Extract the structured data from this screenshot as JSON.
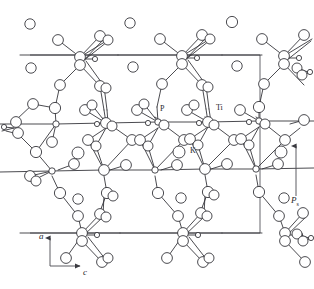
{
  "figure": {
    "background_color": "#ffffff",
    "line_color": "#2b2b30",
    "cell_line_color": "#4a4a50",
    "atom_fill": "#ffffff"
  },
  "labels": {
    "phosphorus": "P",
    "titanium": "Ti",
    "potassium": "K",
    "axis_a": "a",
    "axis_c": "c",
    "polarization": "P",
    "polarization_sub": "s"
  },
  "unit_cell": {
    "left": 12,
    "right": 260,
    "top": 55,
    "bottom": 233
  },
  "axis_indicator": {
    "origin_x": 50,
    "origin_y": 266,
    "vertical_label": "a",
    "horizontal_label": "c",
    "vertical_arrow_direction": "up",
    "horizontal_arrow_direction": "right"
  },
  "polarization_arrow": {
    "x": 296,
    "y_top": 146,
    "y_bottom": 196,
    "direction": "up",
    "label": "Ps"
  },
  "potassium_sites": [
    {
      "x": 30,
      "y": 24,
      "r": 5.2
    },
    {
      "x": 130,
      "y": 23,
      "r": 5.2
    },
    {
      "x": 232,
      "y": 22,
      "r": 5.6
    },
    {
      "x": 31,
      "y": 68,
      "r": 5.2
    },
    {
      "x": 133,
      "y": 67,
      "r": 5.2
    },
    {
      "x": 237,
      "y": 66,
      "r": 5.2
    },
    {
      "x": 78,
      "y": 153,
      "r": 6.0
    },
    {
      "x": 179,
      "y": 152,
      "r": 6.0
    },
    {
      "x": 281,
      "y": 152,
      "r": 6.0
    },
    {
      "x": 78,
      "y": 199,
      "r": 5.2
    },
    {
      "x": 181,
      "y": 198,
      "r": 5.2
    },
    {
      "x": 284,
      "y": 198,
      "r": 5.2
    }
  ],
  "legend_notes": {
    "P_points_to": "phosphorus tetrahedral site",
    "Ti_points_to": "titanium octahedral site",
    "K_points_to": "potassium cation circle"
  }
}
